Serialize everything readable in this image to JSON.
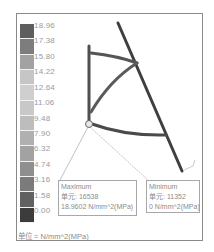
{
  "legend": {
    "ticks": [
      "18.96",
      "17.38",
      "15.80",
      "14.22",
      "12.64",
      "11.06",
      "9.48",
      "7.90",
      "6.32",
      "4.74",
      "3.16",
      "1.58",
      "0.00"
    ],
    "colors": [
      "#5e5e5e",
      "#7d7d7d",
      "#a2a2a2",
      "#c6c6c6",
      "#cfcfcf",
      "#c8c8c8",
      "#bdbdbd",
      "#b0b0b0",
      "#a2a2a2",
      "#8f8f8f",
      "#7b7b7b",
      "#616161",
      "#3c3c3c"
    ],
    "unit_label": "单位 = N/mm^2(MPa)"
  },
  "annotations": {
    "maximum": {
      "title": "Maximum",
      "element": "单元: 16538",
      "value": "18.9602 N/mm^2(MPa)"
    },
    "minimum": {
      "title": "Minimum",
      "element": "单元: 11352",
      "value": "0 N/mm^2(MPa)"
    }
  },
  "model": {
    "member_color": "#4a4a4a",
    "node_color": "#e6e6e6"
  }
}
